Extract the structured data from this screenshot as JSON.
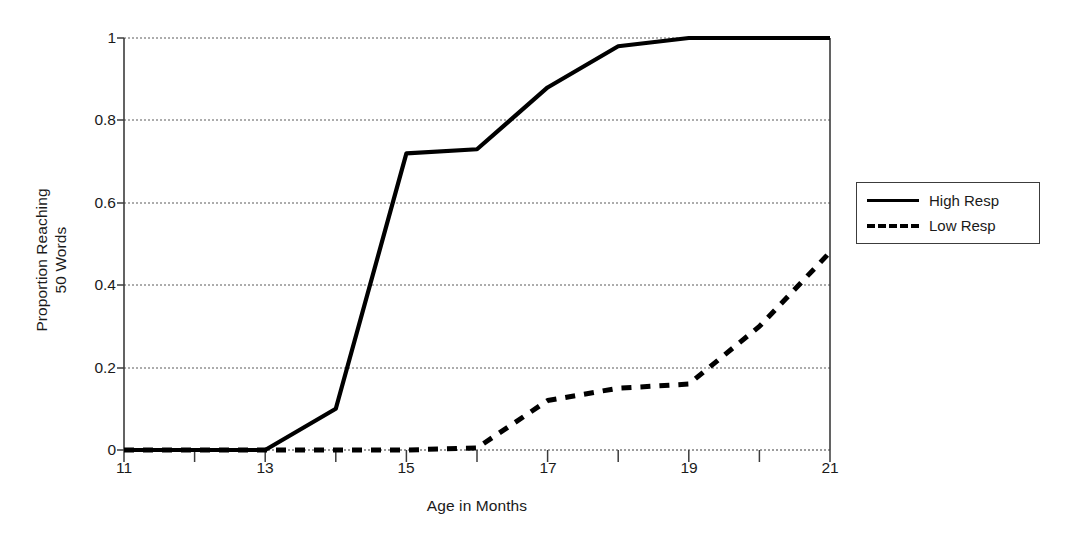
{
  "chart_data": {
    "type": "line",
    "title": "",
    "xlabel": "Age in Months",
    "ylabel": "Proportion Reaching\n50 Words",
    "ylabel_line1": "Proportion Reaching",
    "ylabel_line2": "50 Words",
    "xlim": [
      11,
      21
    ],
    "ylim": [
      0,
      1
    ],
    "xticks": [
      11,
      12,
      13,
      14,
      15,
      16,
      17,
      18,
      19,
      20,
      21
    ],
    "xtick_labels": [
      "11",
      "",
      "13",
      "",
      "15",
      "",
      "17",
      "",
      "19",
      "",
      "21"
    ],
    "xtick_labels_shown": [
      "11",
      "13",
      "15",
      "17",
      "19",
      "21"
    ],
    "yticks": [
      0,
      0.2,
      0.4,
      0.6,
      0.8,
      1
    ],
    "ytick_labels": [
      "0",
      "0.2",
      "0.4",
      "0.6",
      "0.8",
      "1"
    ],
    "grid": "horizontal-dotted",
    "legend_position": "right-outside",
    "x": [
      11,
      12,
      13,
      14,
      15,
      16,
      17,
      18,
      19,
      20,
      21
    ],
    "series": [
      {
        "name": "High Resp",
        "style": "solid",
        "color": "#000000",
        "values": [
          0,
          0,
          0,
          0.1,
          0.72,
          0.73,
          0.88,
          0.98,
          1.0,
          1.0,
          1.0
        ]
      },
      {
        "name": "Low Resp",
        "style": "dashed",
        "color": "#000000",
        "values": [
          0,
          0,
          0,
          0,
          0,
          0.005,
          0.12,
          0.15,
          0.16,
          0.3,
          0.48
        ]
      }
    ]
  },
  "legend": {
    "items": [
      {
        "label": "High Resp",
        "style": "solid"
      },
      {
        "label": "Low Resp",
        "style": "dashed"
      }
    ]
  },
  "axes": {
    "x_title": "Age in Months",
    "y_title_line1": "Proportion Reaching",
    "y_title_line2": "50 Words"
  },
  "colors": {
    "axis": "#3c3c3c",
    "grid": "#6e6e6e",
    "series": "#000000",
    "background": "#ffffff",
    "text": "#1a1a1a"
  }
}
